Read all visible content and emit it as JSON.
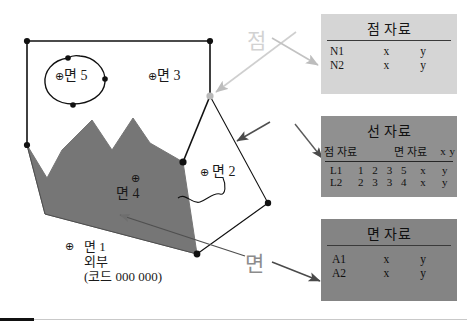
{
  "figure": {
    "map_labels": {
      "area5": "면 5",
      "area3": "면 3",
      "area2": "면 2",
      "area4": "면 4",
      "area1_line1": "면 1",
      "area1_line2": "외부",
      "area1_line3": "(코드  000 000)",
      "centroid_symbol": "⊕"
    },
    "callouts": {
      "point": "점",
      "area": "면"
    },
    "colors": {
      "polygon_fill": "#767676",
      "point_table_bg": "#d5d5d5",
      "line_table_bg": "#909090",
      "area_table_bg": "#848484",
      "callout_point": "#d2d2d2",
      "callout_area": "#8c8c8c",
      "stroke": "#111111"
    }
  },
  "tables": {
    "point": {
      "title": "점 자료",
      "rows": [
        {
          "id": "N1",
          "x": "x",
          "y": "y"
        },
        {
          "id": "N2",
          "x": "x",
          "y": "y"
        }
      ]
    },
    "line": {
      "title": "선 자료",
      "headers": {
        "node": "점 자료",
        "area": "면 자료",
        "x": "x",
        "y": "y"
      },
      "rows": [
        {
          "id": "L1",
          "n1": "1",
          "n2": "2",
          "a1": "3",
          "a2": "5",
          "x": "x",
          "y": "y"
        },
        {
          "id": "L2",
          "n1": "2",
          "n2": "3",
          "a1": "3",
          "a2": "4",
          "x": "x",
          "y": "y"
        }
      ]
    },
    "area": {
      "title": "면 자료",
      "rows": [
        {
          "id": "A1",
          "x": "x",
          "y": "y"
        },
        {
          "id": "A2",
          "x": "x",
          "y": "y"
        }
      ]
    }
  }
}
